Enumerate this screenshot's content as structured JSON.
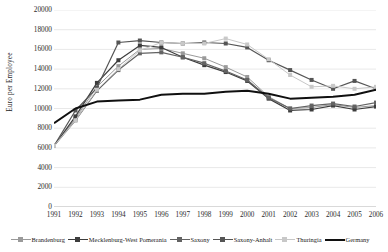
{
  "figure": {
    "cropped_title": "",
    "background": "#ffffff",
    "border": "none"
  },
  "chart_data": {
    "type": "line",
    "title": "",
    "subtitle": "",
    "xlabel": "",
    "ylabel": "Euro per Employee",
    "grid": true,
    "grid_axis": "y",
    "legend_position": "bottom",
    "ylim": [
      0,
      20000
    ],
    "ytick_step": 2000,
    "yticks": [
      0,
      2000,
      4000,
      6000,
      8000,
      10000,
      12000,
      14000,
      16000,
      18000,
      20000
    ],
    "ytick_labels": [
      "0",
      "2000",
      "4000",
      "6000",
      "8000",
      "10000",
      "12000",
      "14000",
      "16000",
      "18000",
      "20000"
    ],
    "categories": [
      "1991",
      "1992",
      "1993",
      "1994",
      "1995",
      "1996",
      "1997",
      "1998",
      "1999",
      "2000",
      "2001",
      "2002",
      "2003",
      "2004",
      "2005",
      "2006"
    ],
    "x": [
      1991,
      1992,
      1993,
      1994,
      1995,
      1996,
      1997,
      1998,
      1999,
      2000,
      2001,
      2002,
      2003,
      2004,
      2005,
      2006
    ],
    "series": [
      {
        "name": "Brandenburg",
        "color": "#9a9a9a",
        "marker": "square",
        "linewidth": 1.0,
        "values": [
          6200,
          9000,
          12200,
          14300,
          16000,
          16100,
          15600,
          15100,
          14200,
          13200,
          11200,
          10000,
          10100,
          10400,
          10100,
          10300
        ]
      },
      {
        "name": "Mecklenburg-West Pomerania",
        "color": "#3d3d3d",
        "marker": "square",
        "linewidth": 1.2,
        "values": [
          6200,
          9200,
          12600,
          14900,
          16400,
          16200,
          15200,
          14400,
          13700,
          12800,
          11000,
          9800,
          9900,
          10300,
          9900,
          10200
        ]
      },
      {
        "name": "Saxony",
        "color": "#636363",
        "marker": "square",
        "linewidth": 1.2,
        "values": [
          6200,
          8800,
          11800,
          13900,
          15600,
          15700,
          15200,
          14600,
          13800,
          12900,
          11100,
          10000,
          10300,
          10500,
          10200,
          10600
        ]
      },
      {
        "name": "Saxony-Anhalt",
        "color": "#555555",
        "marker": "square",
        "linewidth": 1.2,
        "values": [
          6200,
          9800,
          12100,
          16700,
          16900,
          16700,
          16600,
          16700,
          16600,
          16200,
          14900,
          13900,
          12900,
          12000,
          12800,
          12000
        ]
      },
      {
        "name": "Thuringia",
        "color": "#c8c8c8",
        "marker": "square",
        "linewidth": 1.0,
        "values": [
          6200,
          8800,
          11900,
          14000,
          15900,
          16700,
          16600,
          16600,
          17100,
          16500,
          15000,
          13400,
          12200,
          12300,
          12000,
          12200
        ]
      },
      {
        "name": "Germany",
        "color": "#101010",
        "marker": "none",
        "linewidth": 2.0,
        "values": [
          8500,
          10000,
          10700,
          10800,
          10900,
          11400,
          11500,
          11500,
          11700,
          11800,
          11500,
          11000,
          11100,
          11200,
          11400,
          11900
        ]
      }
    ]
  },
  "axes": {
    "ylabel": "Euro per Employee"
  },
  "legend": {
    "items": [
      {
        "label": "Brandenburg",
        "color": "#9a9a9a",
        "marker": "square"
      },
      {
        "label": "Mecklenburg-West Pomerania",
        "color": "#3d3d3d",
        "marker": "square"
      },
      {
        "label": "Saxony",
        "color": "#636363",
        "marker": "square"
      },
      {
        "label": "Saxony-Anhalt",
        "color": "#555555",
        "marker": "square"
      },
      {
        "label": "Thuringia",
        "color": "#c8c8c8",
        "marker": "square"
      },
      {
        "label": "Germany",
        "color": "#101010",
        "marker": "none"
      }
    ]
  }
}
